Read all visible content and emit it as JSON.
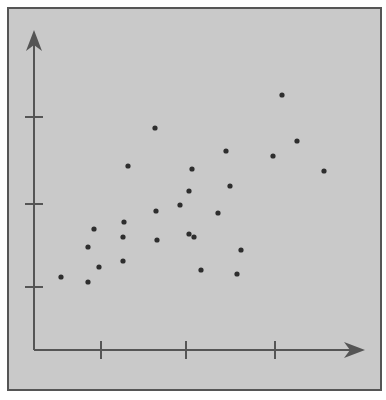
{
  "chart_data": {
    "type": "scatter",
    "title": "",
    "xlabel": "",
    "ylabel": "",
    "x_ticks_px": [
      101,
      186,
      275
    ],
    "y_ticks_px": [
      117,
      204,
      287
    ],
    "x_tick_labels": [
      "",
      "",
      ""
    ],
    "y_tick_labels": [
      "",
      "",
      ""
    ],
    "grid": false,
    "legend": null,
    "axis_ranges_note": "unlabeled axes; x in [0,4] ticks at 1,2,3; y in [0,4] ticks at 1,2,3",
    "xlim": [
      0,
      4
    ],
    "ylim": [
      0,
      4
    ],
    "series": [
      {
        "name": "points",
        "points": [
          {
            "x": 0.32,
            "y": 0.91
          },
          {
            "x": 0.64,
            "y": 0.84
          },
          {
            "x": 0.64,
            "y": 1.25
          },
          {
            "x": 0.76,
            "y": 1.0
          },
          {
            "x": 0.71,
            "y": 1.46
          },
          {
            "x": 1.04,
            "y": 1.06
          },
          {
            "x": 1.04,
            "y": 1.39
          },
          {
            "x": 1.06,
            "y": 1.56
          },
          {
            "x": 1.1,
            "y": 2.2
          },
          {
            "x": 1.43,
            "y": 1.65
          },
          {
            "x": 1.47,
            "y": 1.34
          },
          {
            "x": 1.42,
            "y": 2.64
          },
          {
            "x": 1.7,
            "y": 1.72
          },
          {
            "x": 1.81,
            "y": 1.37
          },
          {
            "x": 1.81,
            "y": 1.96
          },
          {
            "x": 1.86,
            "y": 2.14
          },
          {
            "x": 1.88,
            "y": 1.38
          },
          {
            "x": 1.97,
            "y": 0.95
          },
          {
            "x": 2.25,
            "y": 1.65
          },
          {
            "x": 2.33,
            "y": 2.38
          },
          {
            "x": 2.38,
            "y": 2.0
          },
          {
            "x": 2.44,
            "y": 0.92
          },
          {
            "x": 2.49,
            "y": 1.19
          },
          {
            "x": 2.86,
            "y": 2.33
          },
          {
            "x": 2.95,
            "y": 3.06
          },
          {
            "x": 3.12,
            "y": 2.51
          },
          {
            "x": 3.45,
            "y": 2.17
          }
        ]
      }
    ]
  },
  "colors": {
    "page_bg": "#ffffff",
    "frame_bg": "#c9c9c9",
    "frame_border": "#555555",
    "axis": "#555555",
    "point": "#2e2e2e"
  },
  "geometry": {
    "frame": {
      "x": 8,
      "y": 8,
      "w": 373,
      "h": 382
    },
    "origin": {
      "x": 34,
      "y": 350
    },
    "x_end": 365,
    "y_end": 30,
    "unit_x_px": 85,
    "unit_y_px": 85,
    "pixel_points": [
      [
        61,
        277
      ],
      [
        88,
        282
      ],
      [
        88,
        247
      ],
      [
        99,
        267
      ],
      [
        94,
        229
      ],
      [
        123,
        261
      ],
      [
        123,
        237
      ],
      [
        124,
        222
      ],
      [
        128,
        166
      ],
      [
        156,
        211
      ],
      [
        157,
        240
      ],
      [
        155,
        128
      ],
      [
        180,
        205
      ],
      [
        189,
        234
      ],
      [
        189,
        191
      ],
      [
        192,
        169
      ],
      [
        194,
        237
      ],
      [
        201,
        270
      ],
      [
        218,
        213
      ],
      [
        226,
        151
      ],
      [
        230,
        186
      ],
      [
        237,
        274
      ],
      [
        241,
        250
      ],
      [
        273,
        156
      ],
      [
        282,
        95
      ],
      [
        297,
        141
      ],
      [
        324,
        171
      ]
    ]
  }
}
